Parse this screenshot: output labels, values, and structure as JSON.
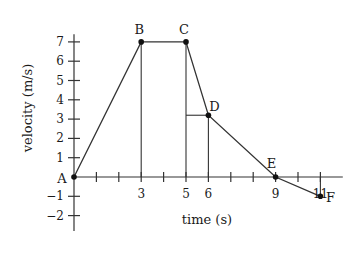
{
  "chart_data": {
    "type": "line",
    "title": "",
    "xlabel": "time (s)",
    "ylabel": "velocity (m/s)",
    "x_ticks": [
      1,
      2,
      3,
      4,
      5,
      6,
      7,
      8,
      9,
      10,
      11
    ],
    "x_tick_labels": [
      {
        "x": 3,
        "label": "3"
      },
      {
        "x": 5,
        "label": "5"
      },
      {
        "x": 6,
        "label": "6"
      },
      {
        "x": 9,
        "label": "9"
      },
      {
        "x": 11,
        "label": "11"
      }
    ],
    "y_ticks": [
      -2,
      -1,
      1,
      2,
      3,
      4,
      5,
      6,
      7
    ],
    "y_tick_labels": [
      "7",
      "6",
      "5",
      "4",
      "3",
      "2",
      "1",
      "−1",
      "−2"
    ],
    "xlim": [
      0,
      12
    ],
    "ylim": [
      -2.8,
      7.5
    ],
    "grid": false,
    "legend": null,
    "points": [
      {
        "label": "A",
        "x": 0,
        "y": 0
      },
      {
        "label": "B",
        "x": 3,
        "y": 7
      },
      {
        "label": "C",
        "x": 5,
        "y": 7
      },
      {
        "label": "D",
        "x": 6,
        "y": 3.2
      },
      {
        "label": "E",
        "x": 9,
        "y": 0
      },
      {
        "label": "F",
        "x": 11,
        "y": -1
      }
    ],
    "guide_lines": [
      {
        "from": [
          3,
          0
        ],
        "to": [
          3,
          7
        ]
      },
      {
        "from": [
          5,
          0
        ],
        "to": [
          5,
          7
        ]
      },
      {
        "from": [
          6,
          0
        ],
        "to": [
          6,
          3.2
        ]
      },
      {
        "from": [
          5,
          3.2
        ],
        "to": [
          6,
          3.2
        ]
      },
      {
        "from": [
          11,
          0
        ],
        "to": [
          11,
          -1
        ]
      }
    ]
  }
}
